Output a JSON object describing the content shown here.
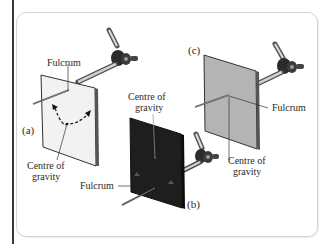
{
  "figure": {
    "panels": [
      {
        "id": "a",
        "tag": "(a)",
        "card_color": "#f2f2f2",
        "labels": {
          "fulcrum": "Fulcrum",
          "cog_line1": "Centre of",
          "cog_line2": "gravity"
        },
        "note": "Fulcrum near top edge; centre of gravity below fulcrum; dashed curved arrow shows swinging"
      },
      {
        "id": "b",
        "tag": "(b)",
        "card_color": "#1e1e1e",
        "labels": {
          "fulcrum": "Fulcrum",
          "cog_line1": "Centre of",
          "cog_line2": "gravity"
        },
        "note": "Fulcrum below centre of gravity; dark card"
      },
      {
        "id": "c",
        "tag": "(c)",
        "card_color": "#b4b4b4",
        "labels": {
          "fulcrum": "Fulcrum",
          "cog_line1": "Centre of",
          "cog_line2": "gravity"
        },
        "note": "Fulcrum at centre of gravity; balanced"
      }
    ],
    "colors": {
      "frame_border": "#d4d4d4",
      "left_rule": "#3a3a3a",
      "text": "#2a2a2a"
    }
  }
}
